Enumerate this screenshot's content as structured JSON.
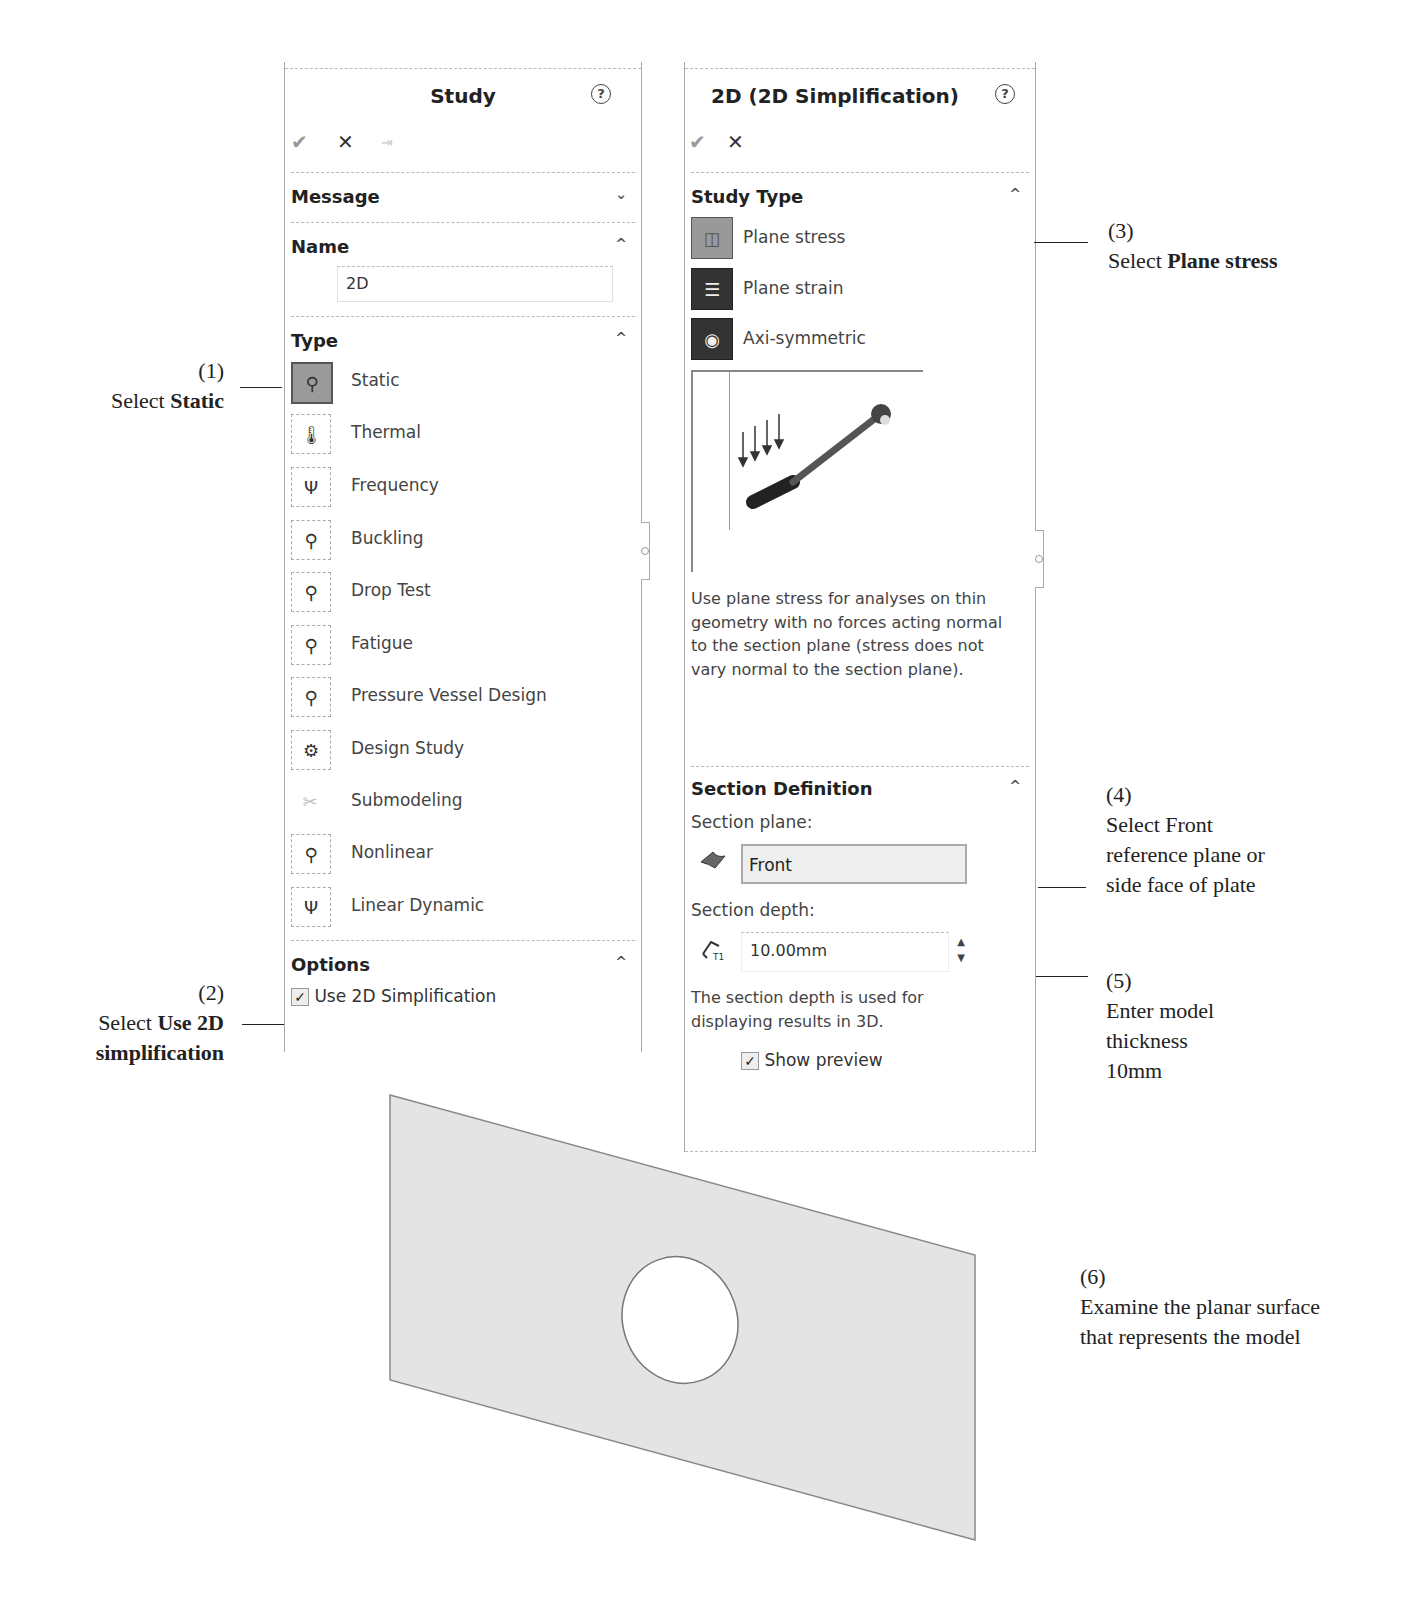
{
  "left_panel": {
    "title": "Study",
    "help_icon": "?",
    "toolbar": {
      "ok": "✔",
      "cancel": "✕",
      "pin": "⇥"
    },
    "sections": {
      "message": {
        "label": "Message",
        "chevron": "⌄"
      },
      "name": {
        "label": "Name",
        "chevron": "^",
        "value": "2D"
      },
      "type": {
        "label": "Type",
        "chevron": "^",
        "items": [
          {
            "label": "Static",
            "icon": "static-icon",
            "glyph": "⚲",
            "selected": true
          },
          {
            "label": "Thermal",
            "icon": "thermal-icon",
            "glyph": "🌡"
          },
          {
            "label": "Frequency",
            "icon": "frequency-icon",
            "glyph": "Ψ"
          },
          {
            "label": "Buckling",
            "icon": "buckling-icon",
            "glyph": "⚲"
          },
          {
            "label": "Drop Test",
            "icon": "drop-test-icon",
            "glyph": "⚲"
          },
          {
            "label": "Fatigue",
            "icon": "fatigue-icon",
            "glyph": "⚲"
          },
          {
            "label": "Pressure Vessel Design",
            "icon": "pressure-vessel-icon",
            "glyph": "⚲"
          },
          {
            "label": "Design Study",
            "icon": "design-study-icon",
            "glyph": "⚙"
          },
          {
            "label": "Submodeling",
            "icon": "submodeling-icon",
            "glyph": "✂"
          },
          {
            "label": "Nonlinear",
            "icon": "nonlinear-icon",
            "glyph": "⚲"
          },
          {
            "label": "Linear Dynamic",
            "icon": "linear-dynamic-icon",
            "glyph": "Ψ"
          }
        ]
      },
      "options": {
        "label": "Options",
        "chevron": "^",
        "checkbox_label": "Use 2D Simplification",
        "checked": "✓"
      }
    }
  },
  "right_panel": {
    "title": "2D (2D Simplification)",
    "help_icon": "?",
    "toolbar": {
      "ok": "✔",
      "cancel": "✕"
    },
    "study_type": {
      "label": "Study Type",
      "chevron": "^",
      "items": [
        {
          "label": "Plane stress",
          "glyph": "◫",
          "selected": true
        },
        {
          "label": "Plane strain",
          "glyph": "☰"
        },
        {
          "label": "Axi-symmetric",
          "glyph": "◉"
        }
      ],
      "description": "Use plane stress for analyses on thin geometry with no forces acting normal to the section plane (stress does not vary normal to the section plane)."
    },
    "section_definition": {
      "label": "Section Definition",
      "chevron": "^",
      "plane_label": "Section plane:",
      "plane_value": "Front",
      "depth_label": "Section depth:",
      "depth_value": "10.00mm",
      "spin_up": "▲",
      "spin_down": "▼",
      "depth_note": "The section depth is used for displaying results in 3D.",
      "show_preview_label": "Show preview",
      "checked": "✓"
    }
  },
  "annotations": {
    "a1": {
      "num": "(1)",
      "pre": "Select ",
      "bold": "Static"
    },
    "a2": {
      "num": "(2)",
      "pre": "Select ",
      "bold1": "Use 2D",
      "bold2": "simplification"
    },
    "a3": {
      "num": "(3)",
      "pre": "Select ",
      "bold": "Plane stress"
    },
    "a4": {
      "num": "(4)",
      "line1": "Select Front",
      "line2": "reference plane or",
      "line3": "side face of plate"
    },
    "a5": {
      "num": "(5)",
      "line1": "Enter model",
      "line2": "thickness",
      "line3": "10mm"
    },
    "a6": {
      "num": "(6)",
      "line1": "Examine the planar surface",
      "line2": "that represents the model"
    }
  }
}
